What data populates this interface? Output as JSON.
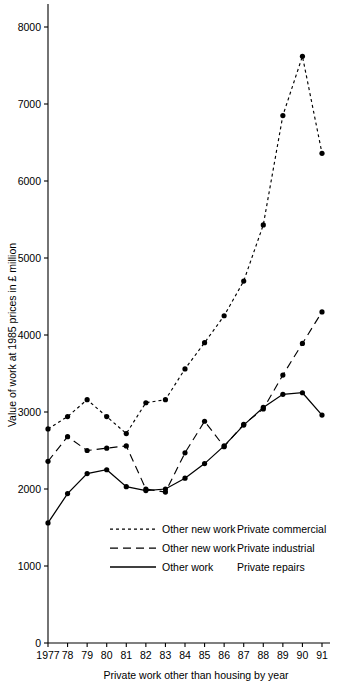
{
  "chart_data": {
    "type": "line",
    "title": "",
    "xlabel": "Private work other than housing by year",
    "ylabel": "Value of work at 1985 prices in £ million",
    "x": [
      1977,
      1978,
      1979,
      1980,
      1981,
      1982,
      1983,
      1984,
      1985,
      1986,
      1987,
      1988,
      1989,
      1990,
      1991
    ],
    "xtick_labels": [
      "1977",
      "78",
      "79",
      "80",
      "81",
      "82",
      "83",
      "84",
      "85",
      "86",
      "87",
      "88",
      "89",
      "90",
      "91"
    ],
    "ytick_labels": [
      "0",
      "1000",
      "2000",
      "3000",
      "4000",
      "5000",
      "6000",
      "7000",
      "8000"
    ],
    "ytick_values": [
      0,
      1000,
      2000,
      3000,
      4000,
      5000,
      6000,
      7000,
      8000
    ],
    "ylim": [
      0,
      8300
    ],
    "xlim": [
      1977,
      1991
    ],
    "grid": false,
    "legend_position": "inside-lower-center",
    "series": [
      {
        "name": "Other new work   Private commercial",
        "label_left": "Other new work",
        "label_right": "Private commercial",
        "style": "dotted",
        "dash": "3,3",
        "color": "#000000",
        "values": [
          2780,
          2940,
          3160,
          2940,
          2720,
          3120,
          3160,
          3560,
          3900,
          4250,
          4700,
          5430,
          6850,
          7620,
          6360
        ]
      },
      {
        "name": "Other new work   Private industrial",
        "label_left": "Other new work",
        "label_right": "Private industrial",
        "style": "dashed",
        "dash": "8,5",
        "color": "#000000",
        "values": [
          2360,
          2680,
          2500,
          2530,
          2560,
          2000,
          1960,
          2470,
          2880,
          2550,
          2840,
          3040,
          3480,
          3890,
          4300
        ]
      },
      {
        "name": "Other work   Private repairs",
        "label_left": "Other work",
        "label_right": "Private repairs",
        "style": "solid",
        "dash": "",
        "color": "#000000",
        "values": [
          1560,
          1940,
          2200,
          2250,
          2030,
          1980,
          2000,
          2140,
          2330,
          2560,
          2830,
          3060,
          3230,
          3250,
          2960
        ]
      }
    ]
  },
  "axes": {
    "y_title": "Value of work at 1985 prices in £ million",
    "x_title": "Private work other than housing by year"
  },
  "legend": {
    "items": [
      {
        "left": "Other new work",
        "right": "Private commercial",
        "style": "dotted"
      },
      {
        "left": "Other new work",
        "right": "Private industrial",
        "style": "dashed"
      },
      {
        "left": "Other work",
        "right": "Private repairs",
        "style": "solid"
      }
    ]
  }
}
